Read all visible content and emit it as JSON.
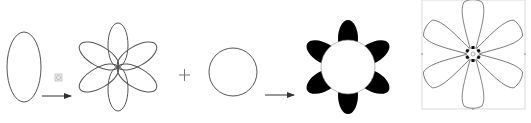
{
  "diagram": {
    "colors": {
      "background": "#ffffff",
      "stroke": "#555555",
      "fill_black": "#000000",
      "guide": "#c8c8c8",
      "icon": "#999999"
    },
    "steps": [
      {
        "id": "ellipse",
        "label": ""
      },
      {
        "id": "arrow-rotate",
        "label": ""
      },
      {
        "id": "six-petal-outline",
        "label": ""
      },
      {
        "id": "plus",
        "label": "+"
      },
      {
        "id": "circle",
        "label": ""
      },
      {
        "id": "arrow-combine",
        "label": ""
      },
      {
        "id": "black-flower",
        "label": ""
      },
      {
        "id": "edited-flower",
        "label": ""
      }
    ],
    "plus_symbol": "+",
    "icons": {
      "rotate_tool": "rotate-tool-icon"
    }
  }
}
